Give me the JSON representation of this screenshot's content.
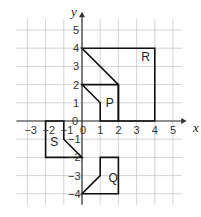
{
  "diagram": {
    "type": "coordinate-grid",
    "axes": {
      "x_label": "x",
      "y_label": "y",
      "x_ticks": [
        "−3",
        "−2",
        "−1",
        "0",
        "1",
        "2",
        "3",
        "4",
        "5"
      ],
      "y_ticks_pos": [
        "1",
        "2",
        "3",
        "4",
        "5"
      ],
      "y_ticks_neg": [
        "−1",
        "−2",
        "−3",
        "−4"
      ],
      "origin_label": "0"
    },
    "shapes": [
      {
        "label": "R",
        "points": [
          [
            0,
            4
          ],
          [
            4,
            4
          ],
          [
            4,
            0
          ],
          [
            2,
            0
          ],
          [
            2,
            2
          ]
        ]
      },
      {
        "label": "P",
        "points": [
          [
            0,
            2
          ],
          [
            2,
            2
          ],
          [
            2,
            0
          ],
          [
            1,
            0
          ],
          [
            1,
            1
          ]
        ]
      },
      {
        "label": "S",
        "points": [
          [
            -2,
            0
          ],
          [
            -1,
            0
          ],
          [
            -1,
            -1
          ],
          [
            0,
            -2
          ],
          [
            -2,
            -2
          ]
        ]
      },
      {
        "label": "Q",
        "points": [
          [
            1,
            -2
          ],
          [
            2,
            -2
          ],
          [
            2,
            -4
          ],
          [
            0,
            -4
          ],
          [
            1,
            -3
          ]
        ]
      }
    ],
    "colors": {
      "grid": "#c8c8c8",
      "axis": "#333333",
      "shape": "#111111"
    }
  }
}
